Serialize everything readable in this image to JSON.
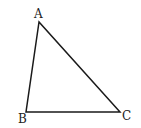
{
  "diagram": {
    "type": "triangle",
    "stroke_color": "#1a1a1a",
    "vertices": [
      {
        "label": "A",
        "x": 39,
        "y": 22
      },
      {
        "label": "B",
        "x": 26,
        "y": 112
      },
      {
        "label": "C",
        "x": 120,
        "y": 112
      }
    ],
    "labels": {
      "A": "A",
      "B": "B",
      "C": "C"
    }
  }
}
